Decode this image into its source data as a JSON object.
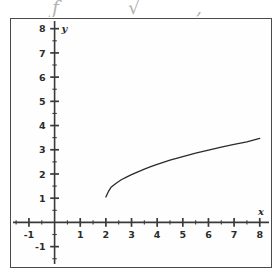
{
  "figure": {
    "top_fragment": {
      "note": "faint cut-off glyph row above the figure frame",
      "glyphs": [
        {
          "char": "ƒ",
          "x": 52,
          "y": -2
        },
        {
          "char": "√",
          "x": 128,
          "y": -2
        },
        {
          "char": ",",
          "x": 196,
          "y": -2
        }
      ]
    },
    "frame": {
      "border_color": "#4a4a4a",
      "background": "#fefefe"
    },
    "axis_labels": {
      "x": "x",
      "y": "y"
    },
    "colors": {
      "axis": "#3a3a3a",
      "curve": "#2a2a2a",
      "text": "#2b2b2b",
      "frame": "#4a4a4a"
    }
  },
  "chart_data": {
    "type": "line",
    "title": "",
    "xlabel": "x",
    "ylabel": "y",
    "xlim": [
      -1.7,
      8.4
    ],
    "ylim": [
      -1.8,
      8.4
    ],
    "grid": false,
    "legend": null,
    "x_ticks": [
      -1,
      1,
      2,
      3,
      4,
      5,
      6,
      7,
      8
    ],
    "x_tick_labels": [
      "-1",
      "1",
      "2",
      "3",
      "4",
      "5",
      "6",
      "7",
      "8"
    ],
    "y_ticks": [
      -1,
      1,
      2,
      3,
      4,
      5,
      6,
      7,
      8
    ],
    "y_tick_labels": [
      "-1",
      "1",
      "2",
      "3",
      "4",
      "5",
      "6",
      "7",
      "8"
    ],
    "minor_ticks": true,
    "minor_tick_step": 0.5,
    "series": [
      {
        "name": "curve",
        "style": "solid",
        "domain": [
          2,
          8
        ],
        "x": [
          2.0,
          2.1,
          2.2,
          2.4,
          2.6,
          2.8,
          3.0,
          3.25,
          3.5,
          3.75,
          4.0,
          4.5,
          5.0,
          5.5,
          6.0,
          6.5,
          7.0,
          7.5,
          8.0
        ],
        "y": [
          1.05,
          1.28,
          1.45,
          1.62,
          1.76,
          1.87,
          1.97,
          2.09,
          2.2,
          2.3,
          2.4,
          2.57,
          2.72,
          2.86,
          2.99,
          3.11,
          3.22,
          3.33,
          3.47
        ]
      }
    ]
  }
}
